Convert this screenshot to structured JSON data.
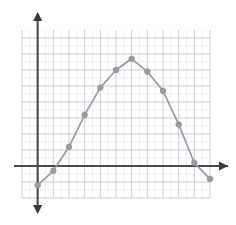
{
  "chart_data": {
    "type": "line",
    "title": "",
    "subtitle": "",
    "xlabel": "",
    "ylabel": "",
    "grid": true,
    "legend": false,
    "legend_position": "none",
    "markers": true,
    "marker_shape": "circle",
    "series_color": "#9b9ba3",
    "axis_color": "#4a4a4a",
    "grid_color": "#c8c8d2",
    "grid_minor_color": "#e9e9ef",
    "xlim": [
      -1,
      11
    ],
    "ylim": [
      -2,
      8.5
    ],
    "x_ticks": [
      -1,
      0,
      1,
      2,
      3,
      4,
      5,
      6,
      7,
      8,
      9,
      10,
      11
    ],
    "y_ticks": [
      -2,
      -1,
      0,
      1,
      2,
      3,
      4,
      5,
      6,
      7,
      8
    ],
    "x_tick_labels": [],
    "y_tick_labels": [],
    "x": [
      0,
      1,
      2,
      3,
      4,
      5,
      6,
      7,
      8,
      9,
      10,
      11
    ],
    "values": [
      -1.2,
      -0.3,
      1.2,
      3.2,
      4.9,
      6.0,
      6.7,
      5.9,
      4.7,
      2.6,
      0.2,
      -0.8
    ],
    "series": [
      {
        "name": "curve",
        "values": [
          -1.2,
          -0.3,
          1.2,
          3.2,
          4.9,
          6.0,
          6.7,
          5.9,
          4.7,
          2.6,
          0.2,
          -0.8
        ]
      }
    ],
    "annotations": []
  },
  "figure": {
    "axis_x_arrow": "arrow-right",
    "axis_y_arrow_top": "arrow-up",
    "axis_y_arrow_bottom": "arrow-down"
  }
}
